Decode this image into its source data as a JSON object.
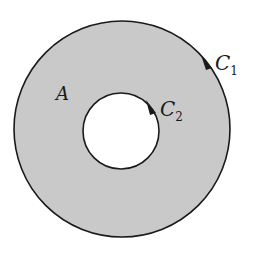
{
  "diagram": {
    "colors": {
      "fill": "#c9c9c9",
      "stroke": "#1a1a1a",
      "background": "#ffffff"
    },
    "region": {
      "label": "A"
    },
    "outer_curve": {
      "label_main": "C",
      "label_sub": "1",
      "direction": "clockwise"
    },
    "inner_curve": {
      "label_main": "C",
      "label_sub": "2",
      "direction": "clockwise"
    }
  }
}
